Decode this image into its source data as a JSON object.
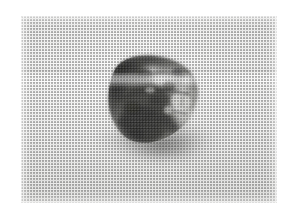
{
  "page": {
    "background_color": "#ffffff",
    "width": 295,
    "height": 223
  },
  "photo": {
    "subject": "seashell",
    "subject_detail": "conical gastropod / whelk shell lying on its side, aperture facing lower-right",
    "caption": "",
    "alt_text": "Halftone-printed black and white photograph of a single seashell on a plain light background",
    "rendering": "halftone dot screen, grayscale",
    "frame": {
      "left": 21,
      "top": 16,
      "width": 256,
      "height": 187,
      "border_color": "#ffffff"
    },
    "background_tone": "#eeeeed",
    "shadow_color": "#50504e",
    "shell": {
      "body_dark": "#232322",
      "body_mid": "#6d6d6a",
      "body_light": "#d8d8d5",
      "highlight": "#f4f4f2",
      "center_x": 139,
      "center_y": 101,
      "rotation_deg": -38
    },
    "artifacts": {
      "horizontal_scan_band": true,
      "vertical_streaks": true
    }
  }
}
